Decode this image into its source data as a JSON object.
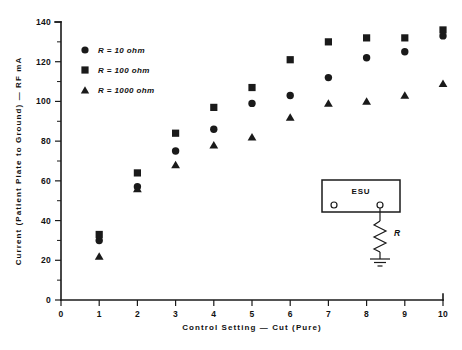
{
  "chart_data": {
    "type": "scatter",
    "title": "",
    "xlabel": "Control Setting  —  Cut (Pure)",
    "ylabel": "Current (Patient Plate to Ground)  —  RF mA",
    "xlim": [
      0,
      10
    ],
    "ylim": [
      0,
      140
    ],
    "x_ticks": [
      0,
      1,
      2,
      3,
      4,
      5,
      6,
      7,
      8,
      9,
      10
    ],
    "x_tick_labels": [
      "0",
      "1",
      "2",
      "3",
      "4",
      "5",
      "6",
      "7",
      "8",
      "9",
      "10"
    ],
    "y_ticks": [
      0,
      20,
      40,
      60,
      80,
      100,
      120,
      140
    ],
    "y_tick_labels": [
      "0",
      "20",
      "40",
      "60",
      "80",
      "100",
      "120",
      "140"
    ],
    "y_minor_ticks": [
      10,
      30,
      50,
      70,
      90,
      110,
      130
    ],
    "grid": false,
    "legend_position": "upper-left",
    "x": [
      1,
      2,
      3,
      4,
      5,
      6,
      7,
      8,
      9,
      10
    ],
    "series": [
      {
        "name": "R = 10 ohm",
        "marker": "circle",
        "color": "#1a1a1a",
        "values": [
          30,
          57,
          75,
          86,
          99,
          103,
          112,
          122,
          125,
          133
        ]
      },
      {
        "name": "R = 100 ohm",
        "marker": "square",
        "color": "#1a1a1a",
        "values": [
          33,
          64,
          84,
          97,
          107,
          121,
          130,
          132,
          132,
          136
        ]
      },
      {
        "name": "R = 1000 ohm",
        "marker": "triangle",
        "color": "#1a1a1a",
        "values": [
          22,
          56,
          68,
          78,
          82,
          92,
          99,
          100,
          103,
          109
        ]
      }
    ],
    "annotations": {
      "inset": {
        "box_label": "ESU",
        "resistor_label": "R",
        "description": "ESU generator output terminals with resistor R to ground"
      }
    }
  },
  "legend": {
    "items": [
      {
        "marker": "circle",
        "label": "R = 10 ohm"
      },
      {
        "marker": "square",
        "label": "R = 100 ohm"
      },
      {
        "marker": "triangle",
        "label": "R = 1000 ohm"
      }
    ]
  },
  "inset": {
    "box_label": "ESU",
    "resistor_label": "R"
  }
}
